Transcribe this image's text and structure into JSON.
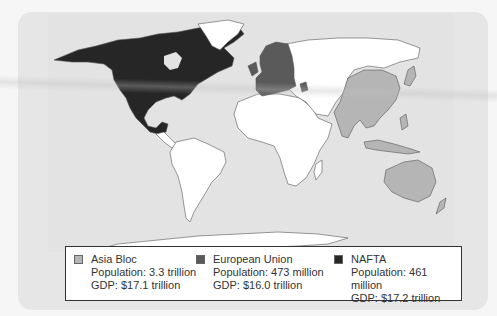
{
  "figure": {
    "type": "world-map"
  },
  "colors": {
    "asia_bloc": "#b5b5b5",
    "european_union": "#5a5a5a",
    "nafta": "#262626",
    "other_land": "#ffffff",
    "ocean": "#e3e3e3",
    "border": "#555555"
  },
  "legend": {
    "items": [
      {
        "name": "Asia Bloc",
        "population": "Population: 3.3 trillion",
        "gdp": "GDP: $17.1 trillion",
        "color": "#b5b5b5"
      },
      {
        "name": "European Union",
        "population": "Population: 473 million",
        "gdp": "GDP: $16.0 trillion",
        "color": "#5a5a5a"
      },
      {
        "name": "NAFTA",
        "population": "Population: 461 million",
        "gdp": "GDP: $17.2 trillion",
        "color": "#262626"
      }
    ]
  },
  "regions": {
    "nafta": [
      "Canada",
      "United States",
      "Mexico"
    ],
    "european_union": [
      "Western Europe",
      "Scandinavia (Sweden, Finland)",
      "Central Europe",
      "Greece"
    ],
    "asia_bloc": [
      "China",
      "India",
      "Southeast Asia",
      "Indonesia",
      "Philippines",
      "Australia",
      "Japan",
      "South Korea"
    ]
  }
}
